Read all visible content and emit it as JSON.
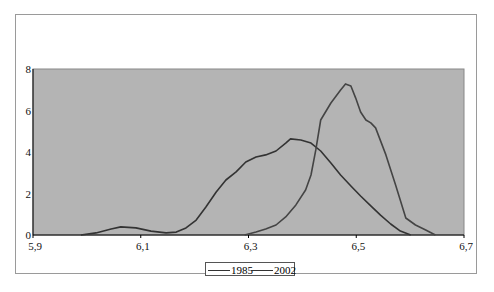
{
  "chart_data": {
    "type": "line",
    "title": "",
    "xlabel": "",
    "ylabel": "",
    "xlim": [
      5.9,
      6.7
    ],
    "ylim": [
      0,
      8
    ],
    "x_ticks": [
      "5,9",
      "6,1",
      "6,3",
      "6,5",
      "6,7"
    ],
    "y_ticks": [
      "0",
      "2",
      "4",
      "6",
      "8"
    ],
    "grid": false,
    "plot_background": "#b4b4b4",
    "legend_position": "bottom",
    "series": [
      {
        "name": "1985",
        "color": "#333333",
        "points": [
          [
            5.989,
            0.0
          ],
          [
            6.017,
            0.1
          ],
          [
            6.045,
            0.29
          ],
          [
            6.063,
            0.39
          ],
          [
            6.091,
            0.34
          ],
          [
            6.119,
            0.19
          ],
          [
            6.147,
            0.1
          ],
          [
            6.166,
            0.14
          ],
          [
            6.184,
            0.34
          ],
          [
            6.203,
            0.72
          ],
          [
            6.221,
            1.35
          ],
          [
            6.24,
            2.07
          ],
          [
            6.258,
            2.65
          ],
          [
            6.277,
            3.04
          ],
          [
            6.295,
            3.52
          ],
          [
            6.314,
            3.76
          ],
          [
            6.332,
            3.86
          ],
          [
            6.351,
            4.05
          ],
          [
            6.369,
            4.43
          ],
          [
            6.378,
            4.63
          ],
          [
            6.397,
            4.58
          ],
          [
            6.416,
            4.43
          ],
          [
            6.434,
            4.05
          ],
          [
            6.453,
            3.47
          ],
          [
            6.471,
            2.89
          ],
          [
            6.49,
            2.36
          ],
          [
            6.508,
            1.88
          ],
          [
            6.527,
            1.4
          ],
          [
            6.545,
            0.96
          ],
          [
            6.564,
            0.53
          ],
          [
            6.582,
            0.19
          ],
          [
            6.601,
            0.0
          ]
        ]
      },
      {
        "name": "2002",
        "color": "#444444",
        "points": [
          [
            6.293,
            0.0
          ],
          [
            6.314,
            0.14
          ],
          [
            6.332,
            0.29
          ],
          [
            6.351,
            0.48
          ],
          [
            6.369,
            0.87
          ],
          [
            6.388,
            1.45
          ],
          [
            6.406,
            2.17
          ],
          [
            6.416,
            2.89
          ],
          [
            6.425,
            4.1
          ],
          [
            6.434,
            5.54
          ],
          [
            6.453,
            6.36
          ],
          [
            6.471,
            6.99
          ],
          [
            6.48,
            7.28
          ],
          [
            6.49,
            7.18
          ],
          [
            6.499,
            6.6
          ],
          [
            6.508,
            5.93
          ],
          [
            6.518,
            5.54
          ],
          [
            6.527,
            5.4
          ],
          [
            6.536,
            5.16
          ],
          [
            6.555,
            3.86
          ],
          [
            6.573,
            2.41
          ],
          [
            6.592,
            0.82
          ],
          [
            6.61,
            0.48
          ],
          [
            6.629,
            0.24
          ],
          [
            6.647,
            0.0
          ]
        ]
      }
    ]
  },
  "legend": {
    "items": [
      {
        "label": "1985"
      },
      {
        "label": "2002"
      }
    ]
  }
}
